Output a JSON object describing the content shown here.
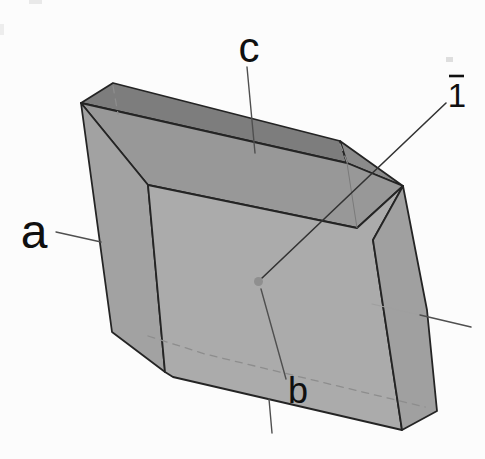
{
  "figure": {
    "kind": "crystal-form-diagram",
    "axis_labels": {
      "a": "a",
      "b": "b",
      "c": "c"
    },
    "symmetry": {
      "label": "1",
      "overbar": true
    },
    "colors": {
      "background": "#fcfcfc",
      "top_face": "#7d7d7d",
      "top_right_bevel": "#8a8a8a",
      "bevel_strip": "#989898",
      "left_rim": "#a2a2a2",
      "front_face": "#ababab",
      "right_rim": "#a0a0a0",
      "edge": "#242424",
      "hidden_edge": "#8d8d8d",
      "axis_line": "#4f4f4f",
      "label_text": "#101010",
      "center_dot": "#8f8f8f"
    }
  }
}
